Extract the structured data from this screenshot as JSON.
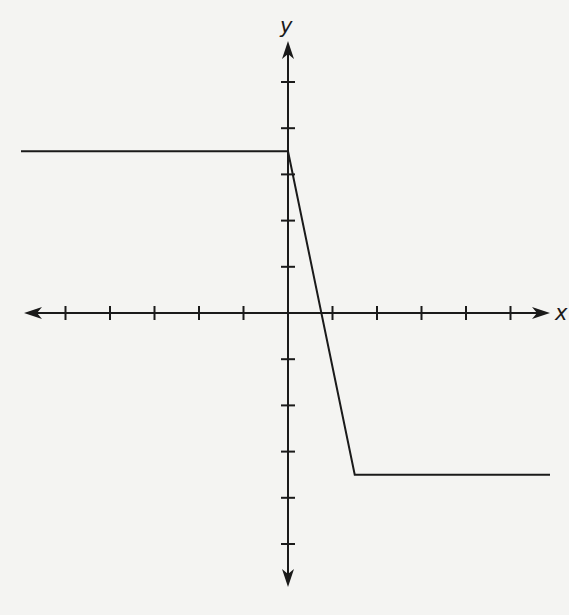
{
  "chart_data": {
    "type": "line",
    "title": "",
    "xlabel": "x",
    "ylabel": "y",
    "grid": false,
    "legend": null,
    "tick_spacing": 1,
    "x_ticks": [
      -5,
      -4,
      -3,
      -2,
      -1,
      1,
      2,
      3,
      4,
      5
    ],
    "y_ticks": [
      -5,
      -4,
      -3,
      -2,
      -1,
      1,
      2,
      3,
      4,
      5
    ],
    "tick_labels_shown": false,
    "xlim": [
      -6,
      6
    ],
    "ylim": [
      -6,
      6
    ],
    "series": [
      {
        "name": "piecewise function",
        "points": [
          {
            "x": -6,
            "y": 3.5
          },
          {
            "x": 0,
            "y": 3.5
          },
          {
            "x": 1.5,
            "y": -3.5
          },
          {
            "x": 6,
            "y": -3.5
          }
        ],
        "color": "#1a1a1a"
      }
    ],
    "annotations": [
      "horizontal segment y = 3.5 for x <= 0",
      "line segment from (0, 3.5) down to (1.5, -3.5), crossing the x-axis near x = 0.75",
      "horizontal segment y = -3.5 for x >= 1.5"
    ]
  },
  "axes": {
    "x_label": "x",
    "y_label": "y"
  },
  "colors": {
    "background": "#f4f4f2",
    "ink": "#1a1a1a"
  }
}
